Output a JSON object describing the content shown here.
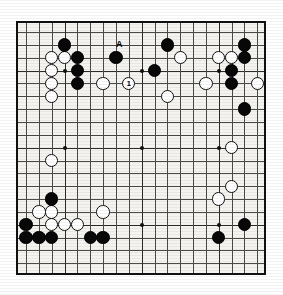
{
  "board": {
    "name": "go-board",
    "size": 19,
    "geometry": {
      "left": 16,
      "top": 21,
      "width": 250,
      "height": 254,
      "cell": 12.85,
      "origin_x": 8.0,
      "origin_y": 9.0,
      "stone_diameter": 13.4
    },
    "colors": {
      "board_background": "#f4f3f0",
      "grid_line": "#4a4a4a",
      "border": "#111111",
      "black_stone": "#080808",
      "white_stone": "#ffffff",
      "white_stone_edge": "#101010",
      "label_text": "#000000"
    },
    "star_points": [
      [
        3,
        3
      ],
      [
        9,
        3
      ],
      [
        15,
        3
      ],
      [
        3,
        9
      ],
      [
        9,
        9
      ],
      [
        15,
        9
      ],
      [
        3,
        15
      ],
      [
        9,
        15
      ],
      [
        15,
        15
      ]
    ],
    "black_stones": [
      [
        3,
        1
      ],
      [
        11,
        1
      ],
      [
        17,
        1
      ],
      [
        4,
        2
      ],
      [
        7,
        2
      ],
      [
        17,
        2
      ],
      [
        4,
        3
      ],
      [
        10,
        3
      ],
      [
        16,
        3
      ],
      [
        4,
        4
      ],
      [
        16,
        4
      ],
      [
        17,
        6
      ],
      [
        2,
        13
      ],
      [
        0,
        15
      ],
      [
        0,
        16
      ],
      [
        1,
        16
      ],
      [
        2,
        16
      ],
      [
        5,
        16
      ],
      [
        6,
        16
      ],
      [
        15,
        16
      ],
      [
        17,
        15
      ]
    ],
    "white_stones": [
      [
        2,
        2
      ],
      [
        3,
        2
      ],
      [
        12,
        2
      ],
      [
        15,
        2
      ],
      [
        16,
        2
      ],
      [
        2,
        3
      ],
      [
        2,
        4
      ],
      [
        6,
        4
      ],
      [
        8,
        4
      ],
      [
        2,
        5
      ],
      [
        11,
        5
      ],
      [
        14,
        4
      ],
      [
        18,
        4
      ],
      [
        2,
        10
      ],
      [
        16,
        9
      ],
      [
        16,
        12
      ],
      [
        1,
        14
      ],
      [
        2,
        14
      ],
      [
        6,
        14
      ],
      [
        2,
        15
      ],
      [
        3,
        15
      ],
      [
        4,
        15
      ],
      [
        15,
        13
      ]
    ],
    "numbered_stones": [
      {
        "col": 8,
        "row": 4,
        "color": "white",
        "number": "1"
      }
    ],
    "point_labels": [
      {
        "col": 7,
        "row": 1,
        "text": "A",
        "offset_x": 3,
        "offset_y": 0
      }
    ]
  }
}
